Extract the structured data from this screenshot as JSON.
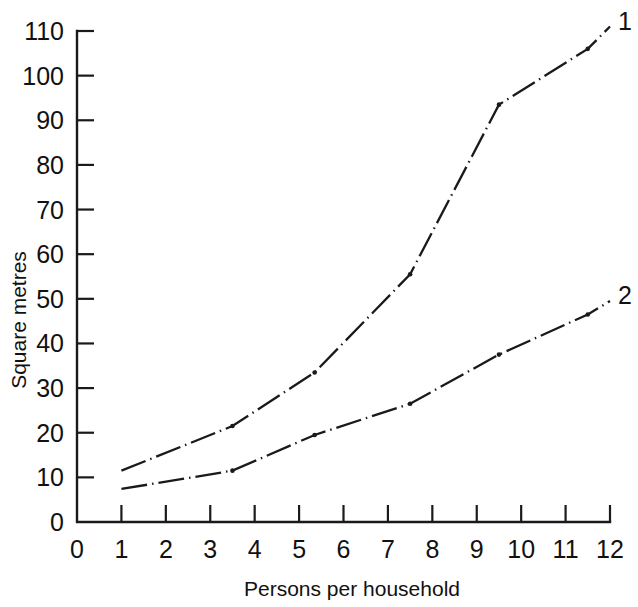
{
  "chart_data": {
    "type": "line",
    "title": "",
    "xlabel": "Persons per household",
    "ylabel": "Square metres",
    "xlim": [
      0,
      12
    ],
    "ylim": [
      0,
      110
    ],
    "xticks": [
      "0",
      "1",
      "2",
      "3",
      "4",
      "5",
      "6",
      "7",
      "8",
      "9",
      "10",
      "11",
      "12"
    ],
    "yticks": [
      "0",
      "10",
      "20",
      "30",
      "40",
      "50",
      "60",
      "70",
      "80",
      "90",
      "100",
      "110"
    ],
    "grid": false,
    "legend_position": "line-end-right",
    "line_style": "dash-dot",
    "marker": "dot-at-vertices",
    "series": [
      {
        "name": "1",
        "label": "1",
        "color": "#1a1a1a",
        "x": [
          1,
          3.5,
          5.35,
          7.5,
          9.5,
          11.5,
          12
        ],
        "values": [
          11.5,
          21.5,
          33.5,
          55.5,
          93.5,
          106,
          111
        ]
      },
      {
        "name": "2",
        "label": "2",
        "color": "#1a1a1a",
        "x": [
          1,
          3.5,
          5.35,
          7.5,
          9.5,
          11.5,
          12
        ],
        "values": [
          7.4,
          11.5,
          19.5,
          26.5,
          37.5,
          46.5,
          49.5
        ]
      }
    ]
  },
  "figure": {
    "background_color": "#ffffff",
    "ink_color": "#1a1a1a"
  }
}
